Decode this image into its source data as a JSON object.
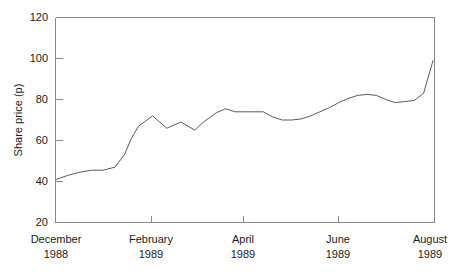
{
  "chart_data": {
    "type": "line",
    "title": "",
    "xlabel": "",
    "ylabel": "Share price (p)",
    "ylim": [
      20,
      120
    ],
    "yticks": [
      20,
      40,
      60,
      80,
      100,
      120
    ],
    "ytick_labels": [
      "20",
      "40",
      "60",
      "80",
      "100",
      "120"
    ],
    "grid": false,
    "legend": "none",
    "xtick_labels": [
      {
        "month": "December",
        "year": "1988"
      },
      {
        "month": "February",
        "year": "1989"
      },
      {
        "month": "April",
        "year": "1989"
      },
      {
        "month": "June",
        "year": "1989"
      },
      {
        "month": "August",
        "year": "1989"
      }
    ],
    "x_axis_range_months": [
      0,
      8
    ],
    "series": [
      {
        "name": "Share price",
        "color": "#5a5a5a",
        "x": [
          0.0,
          0.25,
          0.5,
          0.75,
          1.0,
          1.25,
          1.45,
          1.6,
          1.75,
          1.9,
          2.05,
          2.2,
          2.35,
          2.5,
          2.65,
          2.8,
          2.95,
          3.1,
          3.25,
          3.4,
          3.6,
          3.8,
          4.0,
          4.2,
          4.4,
          4.6,
          4.8,
          5.0,
          5.2,
          5.4,
          5.6,
          5.8,
          6.0,
          6.2,
          6.4,
          6.6,
          6.8,
          7.0,
          7.2,
          7.4,
          7.6,
          7.8,
          8.0
        ],
        "values": [
          41,
          43,
          44.5,
          45.5,
          45.5,
          47,
          53,
          61,
          67,
          69.5,
          72,
          69,
          66,
          67.5,
          69,
          67,
          65,
          68.5,
          71,
          73.5,
          75.5,
          74,
          74,
          74,
          74,
          71.5,
          70,
          70,
          70.5,
          72,
          74,
          76,
          78.5,
          80.5,
          82,
          82.5,
          82,
          80,
          78.5,
          79,
          79.5,
          83,
          99
        ]
      }
    ],
    "annotations": []
  },
  "axes": {
    "y_axis_title": "Share price (p)"
  }
}
